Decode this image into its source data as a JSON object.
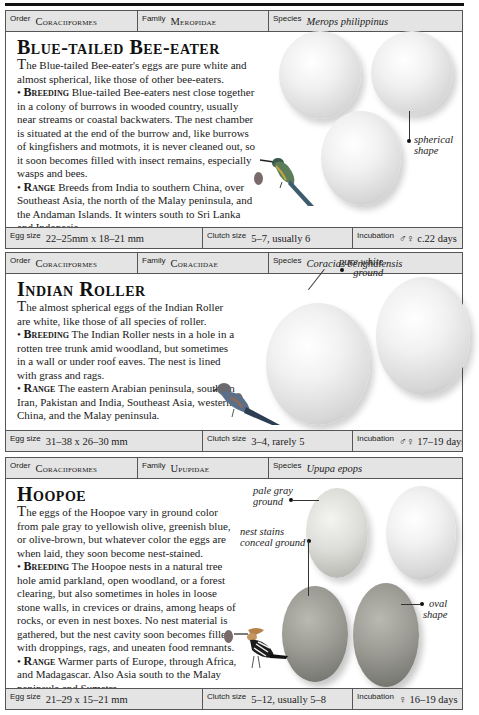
{
  "entries": [
    {
      "header": {
        "order_label": "Order",
        "order": "Coraciiformes",
        "family_label": "Family",
        "family": "Meropidae",
        "species_label": "Species",
        "species": "Merops philippinus"
      },
      "title": "Blue-tailed Bee-eater",
      "intro_cap": "T",
      "intro": "he Blue-tailed Bee-eater's eggs are pure white and almost spherical, like those of other bee-eaters.",
      "breeding_label": "Breeding",
      "breeding": "Blue-tailed Bee-eaters nest close together in a colony of burrows in wooded country, usually near streams or coastal backwaters. The nest chamber is situated at the end of the burrow and, like burrows of kingfishers and motmots, it is never cleaned out, so it soon becomes filled with insect remains, especially wasps and bees.",
      "range_label": "Range",
      "range": "Breeds from India to southern China, over Southeast Asia, the north of the Malay peninsula, and the Andaman Islands. It winters south to Sri Lanka and Indonesia.",
      "annotations": [
        {
          "line1": "spherical",
          "line2": "shape"
        }
      ],
      "footer": {
        "egg_size_label": "Egg size",
        "egg_size": "22–25mm x 18–21 mm",
        "clutch_label": "Clutch size",
        "clutch": "5–7, usually 6",
        "incubation_label": "Incubation",
        "incubation": "♂♀ c.22 days"
      }
    },
    {
      "header": {
        "order_label": "Order",
        "order": "Coraciiformes",
        "family_label": "Family",
        "family": "Coraciidae",
        "species_label": "Species",
        "species": "Coracias benghalensis"
      },
      "title": "Indian Roller",
      "intro_cap": "T",
      "intro": "he almost spherical eggs of the Indian Roller are white, like those of all species of roller.",
      "breeding_label": "Breeding",
      "breeding": "The Indian Roller nests in a hole in a rotten tree trunk amid woodland, but sometimes in a wall or under roof eaves. The nest is lined with grass and rags.",
      "range_label": "Range",
      "range": "The eastern Arabian peninsula, southern Iran, Pakistan and India, Southeast Asia, western China, and the Malay peninsula.",
      "annotations": [
        {
          "line1": "pure white",
          "line2": "ground"
        }
      ],
      "footer": {
        "egg_size_label": "Egg size",
        "egg_size": "31–38 x 26–30 mm",
        "clutch_label": "Clutch size",
        "clutch": "3–4, rarely 5",
        "incubation_label": "Incubation",
        "incubation": "♂♀ 17–19 days"
      }
    },
    {
      "header": {
        "order_label": "Order",
        "order": "Coraciiformes",
        "family_label": "Family",
        "family": "Upupidae",
        "species_label": "Species",
        "species": "Upupa epops"
      },
      "title": "Hoopoe",
      "intro_cap": "T",
      "intro": "he eggs of the Hoopoe vary in ground color from pale gray to yellowish olive, greenish blue, or olive-brown, but whatever color the eggs are when laid, they soon become nest-stained.",
      "breeding_label": "Breeding",
      "breeding": "The Hoopoe nests in a natural tree hole amid parkland, open woodland, or a forest clearing, but also sometimes in holes in loose stone walls, in crevices or drains, among heaps of rocks, or even in nest boxes. No nest material is gathered, but the nest cavity soon becomes filled with droppings, rags, and uneaten food remnants.",
      "range_label": "Range",
      "range": "Warmer parts of Europe, through Africa, and Madagascar. Also Asia south to the Malay peninsula and Sumatra.",
      "annotations": [
        {
          "line1": "pale gray",
          "line2": "ground"
        },
        {
          "line1": "nest stains",
          "line2": "conceal ground"
        },
        {
          "line1": "oval",
          "line2": "shape"
        }
      ],
      "footer": {
        "egg_size_label": "Egg size",
        "egg_size": "21–29 x 15–21 mm",
        "clutch_label": "Clutch size",
        "clutch": "5–12, usually 5–8",
        "incubation_label": "Incubation",
        "incubation": "♀ 16–19 days"
      }
    }
  ]
}
